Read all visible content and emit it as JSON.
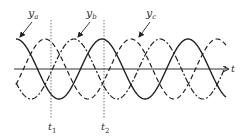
{
  "diagram": {
    "title": "",
    "axis": {
      "label": "t",
      "y": 69,
      "x_start": 16,
      "x_end": 228
    },
    "waves": [
      {
        "name": "y_a",
        "label_main": "y",
        "label_sub": "a",
        "style": "solid",
        "phase_px": 0,
        "label_x": 28,
        "label_y": 17,
        "arrow_from": [
          32,
          22
        ],
        "arrow_to": [
          20,
          37
        ]
      },
      {
        "name": "y_b",
        "label_main": "y",
        "label_sub": "b",
        "style": "dashed",
        "phase_px": 29,
        "label_x": 86,
        "label_y": 17,
        "arrow_from": [
          90,
          22
        ],
        "arrow_to": [
          78,
          37
        ]
      },
      {
        "name": "y_c",
        "label_main": "y",
        "label_sub": "c",
        "style": "dashdot",
        "phase_px": 58,
        "label_x": 146,
        "label_y": 17,
        "arrow_from": [
          150,
          22
        ],
        "arrow_to": [
          139,
          37
        ]
      }
    ],
    "period_px": 86,
    "amplitude_px": 30,
    "markers": [
      {
        "name": "t1",
        "label_main": "t",
        "label_sub": "1",
        "x": 51
      },
      {
        "name": "t2",
        "label_main": "t",
        "label_sub": "2",
        "x": 104
      }
    ],
    "colors": {
      "stroke": "#222222",
      "marker": "#555555",
      "text": "#333333"
    }
  }
}
